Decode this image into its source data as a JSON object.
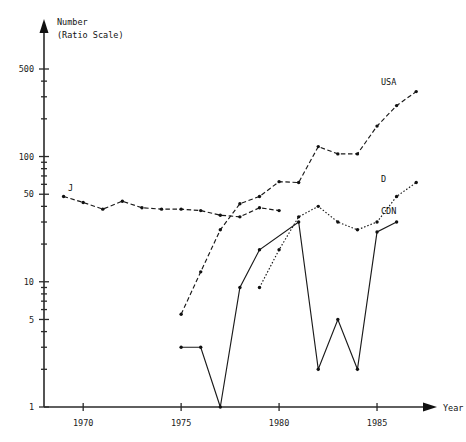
{
  "chart_data": {
    "type": "line",
    "title": "Number",
    "subtitle": "(Ratio Scale)",
    "xlabel": "Year",
    "ylabel": "Number (Ratio Scale)",
    "yscale": "log",
    "ylim": [
      1,
      700
    ],
    "xlim": [
      1968,
      1987.5
    ],
    "grid": false,
    "legend_position": "right-inline-labels",
    "ytick_labels": [
      "1",
      "5",
      "10",
      "50",
      "100",
      "500"
    ],
    "ytick_values": [
      1,
      5,
      10,
      50,
      100,
      500
    ],
    "xtick_labels": [
      "1970",
      "1975",
      "1980",
      "1985"
    ],
    "xtick_values": [
      1970,
      1975,
      1980,
      1985
    ],
    "series": [
      {
        "name": "J",
        "label": "J",
        "style": "dashed",
        "x": [
          1969,
          1970,
          1971,
          1972,
          1973,
          1974,
          1975,
          1976,
          1977,
          1978,
          1979,
          1980
        ],
        "values": [
          48,
          43,
          38,
          44,
          39,
          38,
          38,
          37,
          34,
          33,
          39,
          37
        ]
      },
      {
        "name": "USA",
        "label": "USA",
        "style": "dashed",
        "x": [
          1975,
          1976,
          1977,
          1978,
          1979,
          1980,
          1981,
          1982,
          1983,
          1984,
          1985,
          1986,
          1987
        ],
        "values": [
          5.5,
          12,
          26,
          42,
          48,
          63,
          62,
          120,
          105,
          105,
          175,
          255,
          330
        ]
      },
      {
        "name": "D",
        "label": "D",
        "style": "dotted",
        "x": [
          1979,
          1980,
          1981,
          1982,
          1983,
          1984,
          1985,
          1986,
          1987
        ],
        "values": [
          9,
          18,
          33,
          40,
          30,
          26,
          30,
          48,
          62
        ]
      },
      {
        "name": "CDN",
        "label": "CDN",
        "style": "solid",
        "x": [
          1975,
          1976,
          1977,
          1978,
          1979,
          1981,
          1982,
          1983,
          1984,
          1985,
          1986
        ],
        "values": [
          3,
          3,
          1,
          9,
          18,
          30,
          2,
          5,
          2,
          25,
          30
        ]
      }
    ]
  },
  "axis": {
    "y_title_line1": "Number",
    "y_title_line2": "(Ratio Scale)",
    "x_title": "Year"
  }
}
